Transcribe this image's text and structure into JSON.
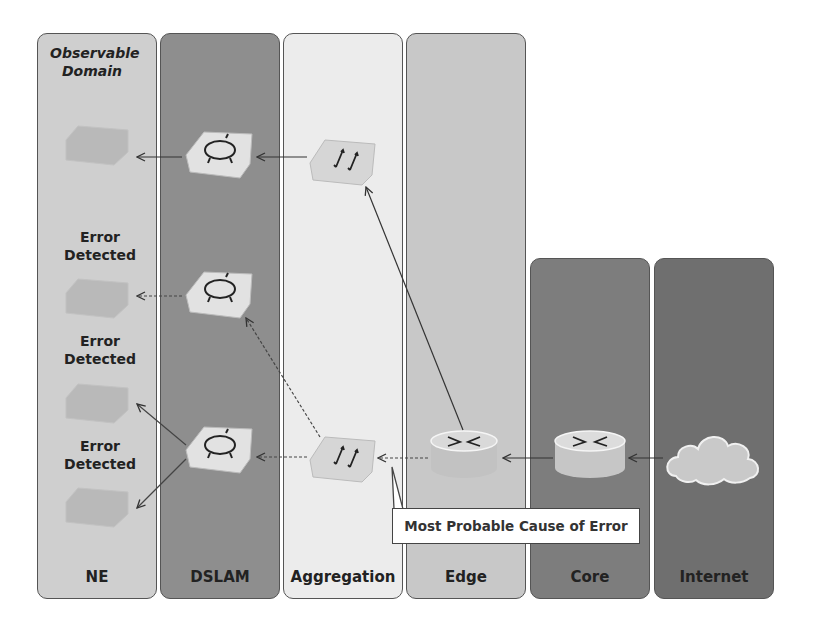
{
  "columns": [
    {
      "id": "ne",
      "label": "NE",
      "color": "#cfcfcf"
    },
    {
      "id": "dslam",
      "label": "DSLAM",
      "color": "#8e8e8e"
    },
    {
      "id": "aggregation",
      "label": "Aggregation",
      "color": "#ececec"
    },
    {
      "id": "edge",
      "label": "Edge",
      "color": "#c8c8c8"
    },
    {
      "id": "core",
      "label": "Core",
      "color": "#7d7d7d"
    },
    {
      "id": "internet",
      "label": "Internet",
      "color": "#6f6f6f"
    }
  ],
  "annotations": {
    "observable_domain": "Observable Domain",
    "observable_line1": "Observable",
    "observable_line2": "Domain",
    "error_line1": "Error",
    "error_line2": "Detected",
    "callout": "Most Probable Cause of Error"
  }
}
